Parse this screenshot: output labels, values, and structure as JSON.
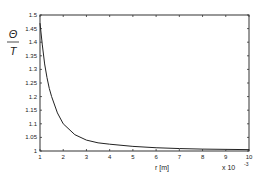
{
  "chart_data": {
    "type": "line",
    "title": "",
    "ylabel_numerator": "Θ",
    "ylabel_denominator": "T",
    "xlabel": "r  [m]",
    "x_multiplier": "x 10",
    "x_multiplier_exp": "-3",
    "xlim": [
      1,
      10
    ],
    "ylim": [
      1,
      1.5
    ],
    "xticks": [
      1,
      2,
      3,
      4,
      5,
      6,
      7,
      8,
      9,
      10
    ],
    "yticks": [
      1,
      1.05,
      1.1,
      1.15,
      1.2,
      1.25,
      1.3,
      1.35,
      1.4,
      1.45,
      1.5
    ],
    "ytick_labels": [
      "1",
      "1.05",
      "1.1",
      "1.15",
      "1.2",
      "1.25",
      "1.3",
      "1.35",
      "1.4",
      "1.45",
      "1.5"
    ],
    "grid": false,
    "legend": null,
    "series": [
      {
        "name": "Θ/T",
        "x": [
          1.0,
          1.1,
          1.2,
          1.3,
          1.4,
          1.5,
          1.75,
          2.0,
          2.5,
          3.0,
          3.5,
          4.0,
          5.0,
          6.0,
          7.0,
          8.0,
          9.0,
          10.0
        ],
        "y": [
          1.47,
          1.39,
          1.32,
          1.27,
          1.23,
          1.2,
          1.14,
          1.1,
          1.06,
          1.04,
          1.03,
          1.025,
          1.017,
          1.012,
          1.009,
          1.007,
          1.006,
          1.005
        ]
      }
    ]
  }
}
